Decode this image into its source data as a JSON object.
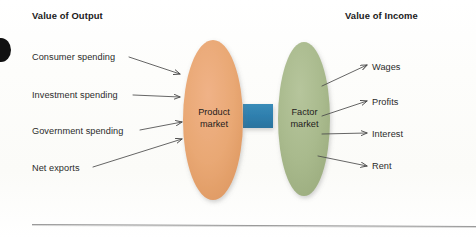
{
  "figure": {
    "kind": "circular-flow-diagram",
    "background_color": "#fdfdfa"
  },
  "headers": {
    "left": "Value of Output",
    "right": "Value of Income"
  },
  "nodes": [
    {
      "id": "product-market",
      "label_line1": "Product",
      "label_line2": "market",
      "shape": "ellipse",
      "color": "#e8a673",
      "cx": 213,
      "cy": 120,
      "rx": 30,
      "ry": 80
    },
    {
      "id": "factor-market",
      "label_line1": "Factor",
      "label_line2": "market",
      "shape": "ellipse",
      "color": "#a9ba8d",
      "cx": 304,
      "cy": 119,
      "rx": 26,
      "ry": 77
    }
  ],
  "connector": {
    "id": "market-connector",
    "shape": "rectangle",
    "color": "#2e7fae",
    "x": 243,
    "y": 104,
    "width": 30,
    "height": 24
  },
  "inflows": {
    "title": "Value of Output",
    "items": [
      {
        "label": "Consumer spending",
        "label_x": 32,
        "label_y": 52,
        "line_x1": 129,
        "line_y1": 57,
        "line_x2": 182,
        "line_y2": 74
      },
      {
        "label": "Investment spending",
        "label_x": 32,
        "label_y": 90,
        "line_x1": 133,
        "line_y1": 95,
        "line_x2": 182,
        "line_y2": 97
      },
      {
        "label": "Government spending",
        "label_x": 32,
        "label_y": 126,
        "line_x1": 140,
        "line_y1": 130,
        "line_x2": 184,
        "line_y2": 123
      },
      {
        "label": "Net exports",
        "label_x": 32,
        "label_y": 163,
        "line_x1": 93,
        "line_y1": 167,
        "line_x2": 184,
        "line_y2": 140
      }
    ]
  },
  "outflows": {
    "title": "Value of Income",
    "items": [
      {
        "label": "Wages",
        "label_x": 372,
        "label_y": 62,
        "line_x1": 325,
        "line_y1": 85,
        "line_x2": 366,
        "line_y2": 66
      },
      {
        "label": "Profits",
        "label_x": 372,
        "label_y": 98,
        "line_x1": 325,
        "line_y1": 115,
        "line_x2": 366,
        "line_y2": 102
      },
      {
        "label": "Interest",
        "label_x": 372,
        "label_y": 130,
        "line_x1": 325,
        "line_y1": 134,
        "line_x2": 366,
        "line_y2": 134
      },
      {
        "label": "Rent",
        "label_x": 372,
        "label_y": 162,
        "line_x1": 322,
        "line_y1": 155,
        "line_x2": 366,
        "line_y2": 166
      }
    ]
  },
  "rule": {
    "id": "bottom-rule",
    "x1": 32,
    "y1": 224,
    "x2": 476,
    "y2": 226,
    "color": "#9a9a9a"
  },
  "margin_mark": {
    "id": "page-edge-mark",
    "color": "#111111",
    "cx": 1,
    "cy": 50,
    "rx": 10,
    "ry": 12
  },
  "colors": {
    "product_market": "#e8a673",
    "factor_market": "#a9ba8d",
    "connector": "#2e7fae",
    "arrow": "#4a4a4a",
    "text": "#2b2b2b",
    "heading": "#1a1a1a",
    "rule": "#9a9a9a"
  }
}
